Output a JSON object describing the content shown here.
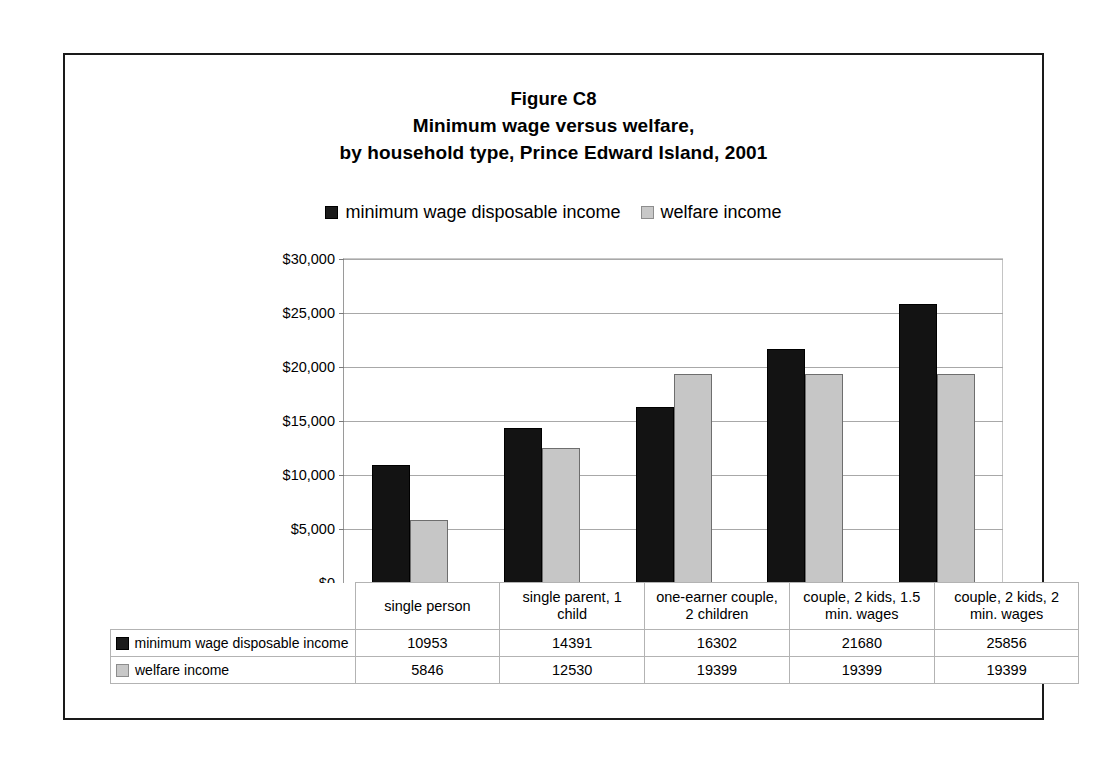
{
  "figure": {
    "title_lines": [
      "Figure C8",
      "Minimum wage versus welfare,",
      "by household type, Prince Edward Island, 2001"
    ]
  },
  "legend": {
    "entries": [
      {
        "label": "minimum wage disposable income",
        "swatch": "dark-square-icon",
        "color": "#1b1b1b"
      },
      {
        "label": "welfare income",
        "swatch": "light-square-icon",
        "color": "#c8c8c8"
      }
    ]
  },
  "axis": {
    "y_ticks": [
      "$30,000",
      "$25,000",
      "$20,000",
      "$15,000",
      "$10,000",
      "$5,000",
      "$0"
    ],
    "y_values": [
      30000,
      25000,
      20000,
      15000,
      10000,
      5000,
      0
    ]
  },
  "table": {
    "row_labels": [
      "minimum wage disposable income",
      "welfare income"
    ],
    "category_header": [
      "single person",
      "single parent, 1 child",
      "one-earner couple, 2 children",
      "couple, 2 kids, 1.5 min. wages",
      "couple, 2 kids, 2 min. wages"
    ],
    "rows": [
      {
        "label": "minimum wage disposable income",
        "values": [
          "10953",
          "14391",
          "16302",
          "21680",
          "25856"
        ]
      },
      {
        "label": "welfare income",
        "values": [
          "5846",
          "12530",
          "19399",
          "19399",
          "19399"
        ]
      }
    ]
  },
  "chart_data": {
    "type": "bar",
    "xlabel": "",
    "ylabel": "",
    "ylim": [
      0,
      30000
    ],
    "ytick_step": 5000,
    "grid": true,
    "legend_position": "top",
    "categories": [
      "single person",
      "single parent, 1 child",
      "one-earner couple, 2 children",
      "couple, 2 kids, 1.5 min. wages",
      "couple, 2 kids, 2 min. wages"
    ],
    "series": [
      {
        "name": "minimum wage disposable income",
        "color": "#131313",
        "values": [
          10953,
          14391,
          16302,
          21680,
          25856
        ]
      },
      {
        "name": "welfare income",
        "color": "#c6c6c6",
        "values": [
          5846,
          12530,
          19399,
          19399,
          19399
        ]
      }
    ]
  }
}
